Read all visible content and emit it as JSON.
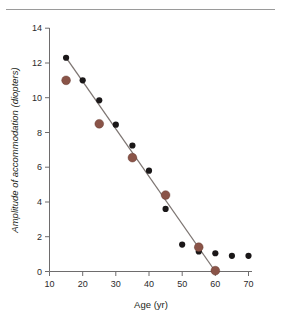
{
  "figure": {
    "top_rule": "divider-rule",
    "caption_fragment": ""
  },
  "chart_data": {
    "type": "scatter",
    "title": "",
    "xlabel": "Age (yr)",
    "ylabel": "Amplitude of accommodation (diopters)",
    "xlim": [
      10,
      70
    ],
    "ylim": [
      0,
      14
    ],
    "xticks": [
      10,
      20,
      30,
      40,
      50,
      60,
      70
    ],
    "yticks": [
      0,
      2,
      4,
      6,
      8,
      10,
      12,
      14
    ],
    "xtick_labels": [
      "10",
      "20",
      "30",
      "40",
      "50",
      "60",
      "70"
    ],
    "ytick_labels": [
      "0",
      "2",
      "4",
      "6",
      "8",
      "10",
      "12",
      "14"
    ],
    "grid": false,
    "legend": false,
    "legend_position": "none",
    "colors": {
      "series_black": "#1a1718",
      "series_brown": "#8a5448",
      "fit_line": "#7d7572",
      "axis": "#6e6c6d"
    },
    "series": [
      {
        "name": "black-markers",
        "marker": "filled-circle",
        "marker_size_px": 3.1,
        "color": "#1a1718",
        "x": [
          15,
          20,
          25,
          30,
          35,
          40,
          45,
          50,
          55,
          60,
          65,
          70
        ],
        "values": [
          12.3,
          11.0,
          9.85,
          8.45,
          7.25,
          5.8,
          3.6,
          1.55,
          1.15,
          1.05,
          0.9,
          0.9
        ]
      },
      {
        "name": "brown-markers",
        "marker": "filled-circle",
        "marker_size_px": 4.4,
        "color": "#8a5448",
        "x": [
          15,
          25,
          35,
          45,
          55,
          60
        ],
        "values": [
          11.0,
          8.5,
          6.55,
          4.4,
          1.4,
          0.05
        ]
      }
    ],
    "fit_line": {
      "name": "regression-line",
      "color": "#7d7572",
      "x": [
        15,
        60
      ],
      "y": [
        12.3,
        0.0
      ]
    }
  }
}
